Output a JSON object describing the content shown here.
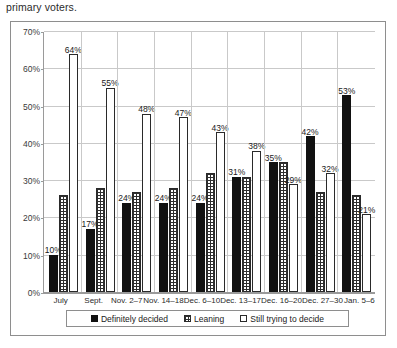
{
  "caption": {
    "text": "primary voters."
  },
  "footer": {
    "text": ""
  },
  "legend": {
    "position": "bottom",
    "items": [
      {
        "label": "Definitely decided",
        "swatch": "solid-black-swatch"
      },
      {
        "label": "Leaning",
        "swatch": "crosshatch-swatch"
      },
      {
        "label": "Still trying to decide",
        "swatch": "empty-white-swatch"
      }
    ]
  },
  "chart_data": {
    "type": "bar",
    "title": "",
    "subtitle": "",
    "xlabel": "",
    "ylabel": "",
    "ylim": [
      0,
      70
    ],
    "ytick_labels": [
      "0%",
      "10%",
      "20%",
      "30%",
      "40%",
      "50%",
      "60%",
      "70%"
    ],
    "ytick_values": [
      0,
      10,
      20,
      30,
      40,
      50,
      60,
      70
    ],
    "grid": true,
    "legend_position": "bottom",
    "categories": [
      "July",
      "Sept.",
      "Nov. 2–7",
      "Nov. 14–18",
      "Dec. 6–10",
      "Dec. 13–17",
      "Dec. 16–20",
      "Dec. 27–30",
      "Jan. 5–6"
    ],
    "series": [
      {
        "name": "Definitely decided",
        "values": [
          10,
          17,
          24,
          24,
          24,
          31,
          35,
          42,
          53
        ],
        "labels": [
          "10%",
          "17%",
          "24%",
          "24%",
          "24%",
          "31%",
          "35%",
          "42%",
          "53%"
        ],
        "labels_shown": [
          true,
          true,
          true,
          true,
          true,
          true,
          true,
          true,
          true
        ]
      },
      {
        "name": "Leaning",
        "values": [
          26,
          28,
          27,
          28,
          32,
          31,
          35,
          27,
          26
        ],
        "labels": [
          "26%",
          "28%",
          "27%",
          "28%",
          "32%",
          "31%",
          "35%",
          "27%",
          "26%"
        ],
        "labels_shown": [
          false,
          false,
          false,
          false,
          false,
          false,
          false,
          false,
          false
        ]
      },
      {
        "name": "Still trying to decide",
        "values": [
          64,
          55,
          48,
          47,
          43,
          38,
          29,
          32,
          21
        ],
        "labels": [
          "64%",
          "55%",
          "48%",
          "47%",
          "43%",
          "38%",
          "29%",
          "32%",
          "21%"
        ],
        "labels_shown": [
          true,
          true,
          true,
          true,
          true,
          true,
          true,
          true,
          true
        ]
      }
    ]
  }
}
